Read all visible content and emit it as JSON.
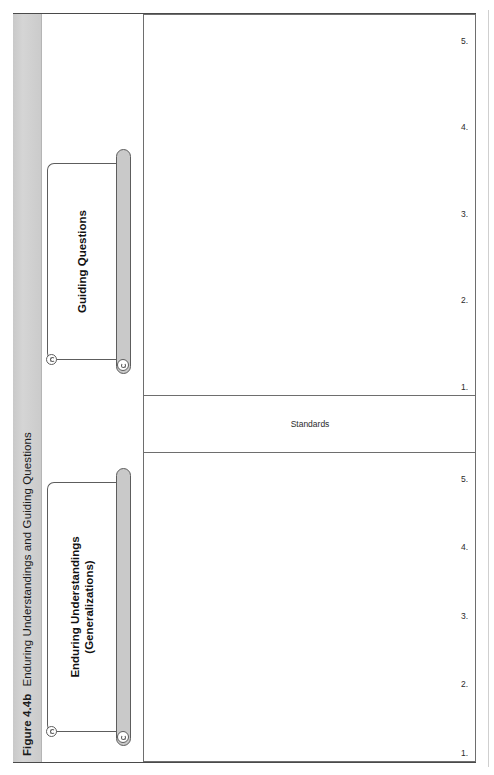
{
  "figure": {
    "number": "Figure 4.4b",
    "title": "Enduring Understandings and Guiding Questions"
  },
  "banners": {
    "left": {
      "line1": "Enduring Understandings",
      "line2": "(Generalizations)",
      "label": "Enduring Understandings\n(Generalizations)"
    },
    "right": {
      "line1": "Guiding Questions",
      "label": "Guiding Questions"
    }
  },
  "table": {
    "standards_label": "Standards",
    "enduring_understandings_items": [
      "1.",
      "2.",
      "3.",
      "4.",
      "5."
    ],
    "guiding_questions_items": [
      "1.",
      "2.",
      "3.",
      "4.",
      "5."
    ]
  },
  "colors": {
    "caption_band": "#d0d0d0",
    "rule": "#6e6e6e",
    "roll_fill": "#c9c9c9",
    "text": "#111111"
  }
}
